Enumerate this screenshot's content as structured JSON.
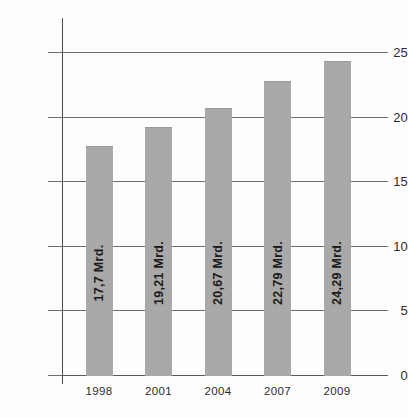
{
  "chart_data": {
    "type": "bar",
    "title": "",
    "subtitle": "",
    "xlabel": "",
    "ylabel": "",
    "categories": [
      "1998",
      "2001",
      "2004",
      "2007",
      "2009"
    ],
    "values": [
      17.7,
      19.21,
      20.67,
      22.79,
      24.29
    ],
    "data_labels": [
      "17,7 Mrd.",
      "19,21 Mrd.",
      "20,67 Mrd.",
      "22,79 Mrd.",
      "24,29 Mrd."
    ],
    "ylim": [
      0,
      27.5
    ],
    "y_ticks": [
      0,
      5,
      10,
      15,
      20,
      25
    ],
    "y_tick_labels": [
      "0",
      "5",
      "10",
      "15",
      "20",
      "25"
    ],
    "grid": true,
    "grid_axis": "y",
    "legend": null,
    "legend_position": "none",
    "bar_color": "#a9a9a9",
    "axis_color": "#4a4a4a",
    "grid_color": "#6e6e6e",
    "text_color": "#1b1b1b",
    "background_color": "#fdfdfd",
    "data_label_orientation": "vertical-bottom-to-top"
  }
}
